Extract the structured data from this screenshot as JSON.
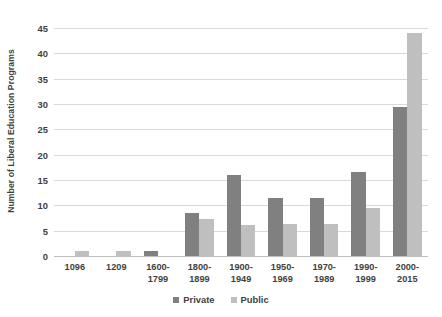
{
  "chart_data": {
    "type": "bar",
    "title": "",
    "subtitle": "",
    "xlabel": "",
    "ylabel": "Number of Liberal Education Programs",
    "ylim": [
      0,
      45
    ],
    "ytick_step": 5,
    "yticks": [
      45,
      40,
      35,
      30,
      25,
      20,
      15,
      10,
      5,
      0
    ],
    "grid": true,
    "legend_position": "bottom",
    "categories": [
      "1096",
      "1209",
      "1600-1799",
      "1800-1899",
      "1900-1949",
      "1950-1969",
      "1970-1989",
      "1990-1999",
      "2000-2015"
    ],
    "category_lines": [
      [
        "1096",
        ""
      ],
      [
        "1209",
        ""
      ],
      [
        "1600-",
        "1799"
      ],
      [
        "1800-",
        "1899"
      ],
      [
        "1900-",
        "1949"
      ],
      [
        "1950-",
        "1969"
      ],
      [
        "1970-",
        "1989"
      ],
      [
        "1990-",
        "1999"
      ],
      [
        "2000-",
        "2015"
      ]
    ],
    "series": [
      {
        "name": "Private",
        "color": "#808080",
        "values": [
          0,
          0,
          1,
          8.5,
          16,
          11.5,
          11.5,
          16.5,
          29.5
        ]
      },
      {
        "name": "Public",
        "color": "#bfbfbf",
        "values": [
          1,
          1,
          0,
          7.3,
          6.2,
          6.3,
          6.3,
          9.5,
          44
        ]
      }
    ]
  },
  "legend": {
    "items": [
      {
        "label": "Private",
        "color": "#808080"
      },
      {
        "label": "Public",
        "color": "#bfbfbf"
      }
    ]
  },
  "colors": {
    "private": "#808080",
    "public": "#bfbfbf",
    "gridline": "#d9d9d9",
    "axis": "#bfbfbf",
    "text": "#3f3f3f",
    "background": "#ffffff"
  }
}
